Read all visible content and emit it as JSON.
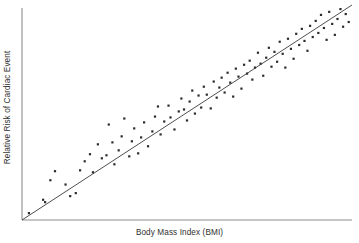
{
  "chart_data": {
    "type": "scatter",
    "title": "",
    "xlabel": "Body Mass Index (BMI)",
    "ylabel": "Relative Risk of Cardiac Event",
    "grid": false,
    "legend": null,
    "axis_ticks": {
      "x": [],
      "y": []
    },
    "xlim": [
      0,
      100
    ],
    "ylim": [
      0,
      100
    ],
    "colors": {
      "point": "#2b2b2b",
      "trend_line": "#3a3a3a",
      "axis": "#8d8d8d",
      "background": "#ffffff",
      "label_text": "#2f2f2f"
    },
    "trend_line": {
      "visible": true,
      "x": [
        0,
        100
      ],
      "y": [
        0,
        100
      ],
      "description": "positive linear fit through origin"
    },
    "points": [
      [
        2.1,
        3.2
      ],
      [
        6.4,
        9.4
      ],
      [
        7.0,
        8.3
      ],
      [
        8.6,
        18.5
      ],
      [
        10.0,
        22.7
      ],
      [
        13.2,
        16.5
      ],
      [
        14.6,
        11.1
      ],
      [
        16.3,
        12.5
      ],
      [
        17.6,
        23.1
      ],
      [
        19.0,
        27.3
      ],
      [
        20.6,
        30.6
      ],
      [
        21.5,
        22.2
      ],
      [
        23.0,
        35.2
      ],
      [
        24.2,
        28.7
      ],
      [
        25.6,
        30.1
      ],
      [
        26.3,
        44.4
      ],
      [
        27.4,
        36.1
      ],
      [
        28.0,
        25.9
      ],
      [
        29.3,
        32.4
      ],
      [
        30.2,
        38.9
      ],
      [
        31.0,
        47.2
      ],
      [
        32.5,
        29.6
      ],
      [
        33.3,
        36.6
      ],
      [
        34.0,
        42.6
      ],
      [
        35.2,
        31.0
      ],
      [
        36.1,
        38.4
      ],
      [
        37.0,
        45.4
      ],
      [
        38.2,
        34.3
      ],
      [
        39.5,
        41.2
      ],
      [
        40.3,
        48.1
      ],
      [
        41.2,
        52.8
      ],
      [
        42.0,
        39.8
      ],
      [
        43.1,
        45.8
      ],
      [
        44.4,
        53.2
      ],
      [
        45.0,
        47.7
      ],
      [
        46.2,
        42.1
      ],
      [
        47.5,
        50.5
      ],
      [
        48.3,
        56.5
      ],
      [
        49.1,
        51.4
      ],
      [
        50.0,
        46.3
      ],
      [
        50.8,
        55.1
      ],
      [
        51.6,
        60.2
      ],
      [
        52.4,
        49.5
      ],
      [
        53.5,
        57.9
      ],
      [
        54.3,
        52.3
      ],
      [
        55.1,
        62.0
      ],
      [
        56.0,
        58.3
      ],
      [
        57.2,
        51.9
      ],
      [
        58.1,
        64.4
      ],
      [
        59.0,
        56.9
      ],
      [
        59.8,
        61.6
      ],
      [
        60.5,
        66.2
      ],
      [
        61.4,
        59.3
      ],
      [
        62.3,
        68.5
      ],
      [
        63.1,
        63.9
      ],
      [
        64.0,
        57.4
      ],
      [
        64.8,
        70.4
      ],
      [
        65.6,
        66.7
      ],
      [
        66.5,
        61.1
      ],
      [
        67.3,
        72.2
      ],
      [
        68.2,
        68.1
      ],
      [
        69.0,
        74.1
      ],
      [
        69.8,
        65.3
      ],
      [
        70.6,
        70.9
      ],
      [
        71.5,
        77.8
      ],
      [
        72.3,
        72.7
      ],
      [
        73.1,
        67.1
      ],
      [
        74.0,
        75.5
      ],
      [
        74.8,
        80.1
      ],
      [
        75.6,
        71.3
      ],
      [
        76.5,
        78.2
      ],
      [
        77.3,
        73.6
      ],
      [
        78.1,
        82.9
      ],
      [
        79.0,
        77.3
      ],
      [
        79.8,
        70.9
      ],
      [
        80.6,
        84.3
      ],
      [
        81.5,
        79.6
      ],
      [
        82.3,
        75.0
      ],
      [
        83.1,
        86.6
      ],
      [
        84.0,
        81.4
      ],
      [
        84.8,
        88.9
      ],
      [
        85.6,
        83.3
      ],
      [
        86.5,
        78.7
      ],
      [
        87.3,
        90.3
      ],
      [
        88.1,
        85.1
      ],
      [
        89.0,
        92.6
      ],
      [
        89.8,
        87.0
      ],
      [
        90.6,
        95.4
      ],
      [
        91.5,
        89.3
      ],
      [
        92.3,
        83.8
      ],
      [
        93.1,
        96.8
      ],
      [
        94.0,
        91.2
      ],
      [
        94.8,
        86.1
      ],
      [
        95.6,
        93.5
      ],
      [
        96.5,
        98.1
      ],
      [
        97.3,
        89.9
      ],
      [
        98.1,
        95.8
      ],
      [
        99.0,
        92.1
      ]
    ]
  }
}
